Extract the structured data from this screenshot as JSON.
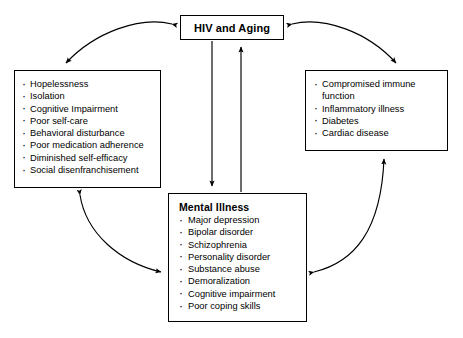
{
  "diagram": {
    "type": "concept-map",
    "nodes": {
      "hiv": {
        "id": "hiv-and-aging",
        "title": "HIV and Aging",
        "items": []
      },
      "psychosocial": {
        "id": "psychosocial-factors",
        "title": "",
        "items": [
          "Hopelessness",
          "Isolation",
          "Cognitive Impairment",
          "Poor self-care",
          "Behavioral disturbance",
          "Poor medication adherence",
          "Diminished self-efficacy",
          "Social disenfranchisement"
        ]
      },
      "medical": {
        "id": "medical-comorbidities",
        "title": "",
        "items": [
          "Compromised immune function",
          "Inflammatory illness",
          "Diabetes",
          "Cardiac disease"
        ]
      },
      "mental": {
        "id": "mental-illness",
        "title": "Mental Illness",
        "items": [
          "Major depression",
          "Bipolar disorder",
          "Schizophrenia",
          "Personality disorder",
          "Substance abuse",
          "Demoralization",
          "Cognitive impairment",
          "Poor coping skills"
        ]
      }
    },
    "edges": [
      {
        "from": "hiv",
        "to": "psychosocial",
        "style": "curved",
        "heads": "both"
      },
      {
        "from": "hiv",
        "to": "medical",
        "style": "curved",
        "heads": "both"
      },
      {
        "from": "hiv",
        "to": "mental",
        "style": "straight",
        "heads": "both"
      },
      {
        "from": "psychosocial",
        "to": "mental",
        "style": "curved",
        "heads": "both"
      },
      {
        "from": "mental",
        "to": "medical",
        "style": "curved",
        "heads": "both"
      }
    ],
    "colors": {
      "stroke": "#000000",
      "background": "#ffffff",
      "text": "#000000"
    }
  }
}
